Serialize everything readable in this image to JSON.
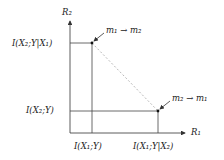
{
  "diagram": {
    "axes": {
      "x_label": "R₁",
      "y_label": "R₂"
    },
    "y_ticks": [
      {
        "label": "I(X₂;Y|X₁)"
      },
      {
        "label": "I(X₂;Y)"
      }
    ],
    "x_ticks": [
      {
        "label": "I(X₁;Y)"
      },
      {
        "label": "I(X₁;Y|X₂)"
      }
    ],
    "points": [
      {
        "label": "m₁ → m₂"
      },
      {
        "label": "m₂ → m₁"
      }
    ],
    "colors": {
      "axis": "#333333",
      "line": "#444444",
      "dashed": "#999999",
      "point": "#111111"
    }
  }
}
